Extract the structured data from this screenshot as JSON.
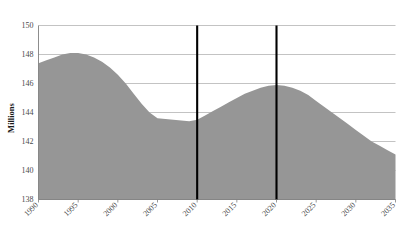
{
  "chart_data": {
    "type": "area",
    "title": "",
    "subtitle": "",
    "xlabel": "",
    "ylabel": "Millions",
    "xlim": [
      1990,
      2035
    ],
    "ylim": [
      138,
      150
    ],
    "grid": true,
    "legend": null,
    "y_ticks": [
      "150",
      "148",
      "146",
      "144",
      "142",
      "140",
      "138"
    ],
    "y_tick_values": [
      150,
      148,
      146,
      144,
      142,
      140,
      138
    ],
    "x_ticks": [
      "1990",
      "1995",
      "2000",
      "2005",
      "2010",
      "2015",
      "2020",
      "2025",
      "2030",
      "2035"
    ],
    "x_tick_values": [
      1990,
      1995,
      2000,
      2005,
      2010,
      2015,
      2020,
      2025,
      2030,
      2035
    ],
    "series": [
      {
        "name": "Population",
        "fill_color": "#969696",
        "x": [
          1990,
          1991,
          1992,
          1993,
          1994,
          1995,
          1996,
          1997,
          1998,
          1999,
          2000,
          2001,
          2002,
          2003,
          2004,
          2005,
          2006,
          2007,
          2008,
          2009,
          2010,
          2011,
          2012,
          2013,
          2014,
          2015,
          2016,
          2017,
          2018,
          2019,
          2020,
          2021,
          2022,
          2023,
          2024,
          2025,
          2026,
          2027,
          2028,
          2029,
          2030,
          2031,
          2032,
          2033,
          2034,
          2035
        ],
        "values": [
          147.4,
          147.6,
          147.8,
          148.0,
          148.1,
          148.1,
          148.0,
          147.8,
          147.5,
          147.1,
          146.6,
          146.0,
          145.3,
          144.6,
          144.0,
          143.6,
          143.55,
          143.5,
          143.45,
          143.4,
          143.5,
          143.8,
          144.1,
          144.4,
          144.7,
          145.0,
          145.3,
          145.5,
          145.7,
          145.85,
          145.9,
          145.85,
          145.7,
          145.5,
          145.2,
          144.8,
          144.4,
          144.0,
          143.6,
          143.2,
          142.8,
          142.4,
          142.0,
          141.7,
          141.4,
          141.1
        ]
      }
    ],
    "annotations": [
      {
        "name": "reference-line-2010",
        "type": "vline",
        "x": 2010,
        "color": "#000000"
      },
      {
        "name": "reference-line-2020",
        "type": "vline",
        "x": 2020,
        "color": "#000000"
      }
    ],
    "colors": {
      "area_fill": "#969696",
      "gridline": "#b4b4b4",
      "axis": "#808080",
      "reference_line": "#000000",
      "tick_label": "#4a4a4a",
      "axis_title": "#1a1a1a",
      "background": "#ffffff"
    }
  }
}
